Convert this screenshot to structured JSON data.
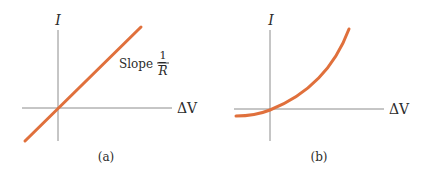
{
  "figure": {
    "panels": [
      {
        "id": "a",
        "caption": "(a)",
        "y_axis_label": "I",
        "x_axis_label": "ΔV",
        "annotation": {
          "prefix": "Slope = ",
          "numerator": "1",
          "denominator": "R"
        },
        "curve": "linear through origin"
      },
      {
        "id": "b",
        "caption": "(b)",
        "y_axis_label": "I",
        "x_axis_label": "ΔV",
        "curve": "nonlinear, increasing, concave up"
      }
    ],
    "colors": {
      "curve": "#e0703c",
      "axis": "#8c8c8c",
      "text": "#2b2b2b"
    }
  }
}
